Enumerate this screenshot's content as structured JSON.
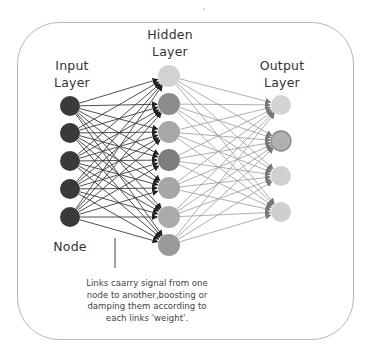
{
  "diagram": {
    "type": "neural-network",
    "labels": {
      "input_layer": [
        "Input",
        "Layer"
      ],
      "hidden_layer": [
        "Hidden",
        "Layer"
      ],
      "output_layer": [
        "Output",
        "Layer"
      ],
      "node": "Node"
    },
    "caption": [
      "Links caarry signal from one",
      "node to another,boosting or",
      "damping them according to",
      "each links 'weight'."
    ],
    "layers": [
      {
        "name": "input",
        "count": 5,
        "x": 70,
        "radius": 10,
        "ys": [
          106,
          133,
          161,
          189,
          217
        ],
        "colors": [
          "#3a3a3a",
          "#3a3a3a",
          "#3a3a3a",
          "#3a3a3a",
          "#3a3a3a"
        ]
      },
      {
        "name": "hidden",
        "count": 7,
        "x": 169,
        "radius": 11,
        "ys": [
          76,
          104,
          132,
          160,
          188,
          217,
          245
        ],
        "colors": [
          "#d2d2d2",
          "#8c8c8c",
          "#a8a8a8",
          "#7e7e7e",
          "#a6a6a6",
          "#aaaaaa",
          "#9a9a9a"
        ]
      },
      {
        "name": "output",
        "count": 4,
        "x": 281,
        "radius": 10,
        "ys": [
          105,
          141,
          176,
          212
        ],
        "colors": [
          "#d4d4d4",
          "#b0b0b0",
          "#d0d0d0",
          "#cfcfcf"
        ]
      }
    ],
    "link_colors": {
      "input_to_hidden": "#3c3c3c",
      "hidden_to_output": "#9a9a9a"
    },
    "frame_color": "#b8b8b8"
  }
}
